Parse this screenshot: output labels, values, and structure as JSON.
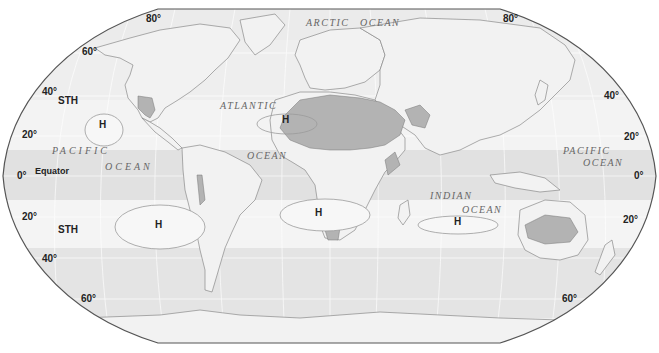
{
  "map": {
    "title": "Subtropical high pressure belts and world deserts",
    "projection": "Robinson",
    "colors": {
      "background": "#ffffff",
      "ocean_base": "#e9e9e9",
      "band_light": "#f4f4f4",
      "band_mid": "#e3e3e3",
      "land": "#f2f2f2",
      "desert": "#b3b3b3",
      "coast": "#8a8a8a",
      "border": "#555555"
    },
    "latitude_labels": {
      "left": [
        {
          "text": "80°",
          "x": 146,
          "y": 22
        },
        {
          "text": "60°",
          "x": 82,
          "y": 52
        },
        {
          "text": "40°",
          "x": 42,
          "y": 92
        },
        {
          "text": "20°",
          "x": 22,
          "y": 135
        },
        {
          "text": "0°",
          "x": 17,
          "y": 176
        },
        {
          "text": "20°",
          "x": 22,
          "y": 217
        },
        {
          "text": "40°",
          "x": 42,
          "y": 259
        },
        {
          "text": "60°",
          "x": 81,
          "y": 299
        }
      ],
      "right": [
        {
          "text": "80°",
          "x": 503,
          "y": 22
        },
        {
          "text": "40°",
          "x": 604,
          "y": 96
        },
        {
          "text": "20°",
          "x": 624,
          "y": 137
        },
        {
          "text": "0°",
          "x": 634,
          "y": 176
        },
        {
          "text": "20°",
          "x": 623,
          "y": 220
        },
        {
          "text": "60°",
          "x": 562,
          "y": 299
        }
      ]
    },
    "belt_labels": [
      {
        "text": "STH",
        "x": 58,
        "y": 101
      },
      {
        "text": "STH",
        "x": 58,
        "y": 230
      },
      {
        "text": "Equator",
        "x": 35,
        "y": 172
      }
    ],
    "high_pressure_cells": [
      {
        "label": "H",
        "x": 99,
        "y": 125,
        "ellipse": {
          "cx": 104,
          "cy": 130,
          "rx": 19,
          "ry": 16
        }
      },
      {
        "label": "H",
        "x": 282,
        "y": 120,
        "ellipse": {
          "cx": 287,
          "cy": 124,
          "rx": 30,
          "ry": 10
        }
      },
      {
        "label": "H",
        "x": 155,
        "y": 225,
        "ellipse": {
          "cx": 160,
          "cy": 227,
          "rx": 45,
          "ry": 22
        }
      },
      {
        "label": "H",
        "x": 315,
        "y": 213,
        "ellipse": {
          "cx": 325,
          "cy": 215,
          "rx": 45,
          "ry": 16
        }
      },
      {
        "label": "H",
        "x": 454,
        "y": 222,
        "ellipse": {
          "cx": 458,
          "cy": 225,
          "rx": 40,
          "ry": 9
        }
      }
    ],
    "ocean_labels": [
      {
        "text": "ARCTIC",
        "x": 306,
        "y": 23
      },
      {
        "text": "OCEAN",
        "x": 360,
        "y": 23
      },
      {
        "text": "ATLANTIC",
        "x": 220,
        "y": 106
      },
      {
        "text": "OCEAN",
        "x": 247,
        "y": 156
      },
      {
        "text": "PACIFIC",
        "x": 52,
        "y": 151
      },
      {
        "text": "OCEAN",
        "x": 105,
        "y": 167
      },
      {
        "text": "INDIAN",
        "x": 430,
        "y": 196
      },
      {
        "text": "OCEAN",
        "x": 462,
        "y": 210
      },
      {
        "text": "PACIFIC",
        "x": 563,
        "y": 151
      },
      {
        "text": "OCEAN",
        "x": 583,
        "y": 163
      }
    ]
  }
}
